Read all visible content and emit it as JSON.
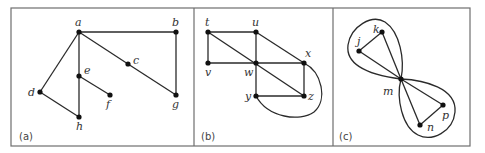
{
  "figure": {
    "panels": [
      {
        "id": "a",
        "caption": "(a)",
        "vertices": [
          {
            "id": "a",
            "label": "a"
          },
          {
            "id": "b",
            "label": "b"
          },
          {
            "id": "c",
            "label": "c"
          },
          {
            "id": "d",
            "label": "d"
          },
          {
            "id": "e",
            "label": "e"
          },
          {
            "id": "f",
            "label": "f"
          },
          {
            "id": "g",
            "label": "g"
          },
          {
            "id": "h",
            "label": "h"
          }
        ],
        "edges": [
          [
            "a",
            "b"
          ],
          [
            "b",
            "g"
          ],
          [
            "a",
            "c"
          ],
          [
            "c",
            "g"
          ],
          [
            "a",
            "d"
          ],
          [
            "a",
            "e"
          ],
          [
            "e",
            "h"
          ],
          [
            "e",
            "f"
          ],
          [
            "d",
            "h"
          ]
        ],
        "loops": []
      },
      {
        "id": "b",
        "caption": "(b)",
        "vertices": [
          {
            "id": "t",
            "label": "t"
          },
          {
            "id": "u",
            "label": "u"
          },
          {
            "id": "v",
            "label": "v"
          },
          {
            "id": "w",
            "label": "w"
          },
          {
            "id": "x",
            "label": "x"
          },
          {
            "id": "y",
            "label": "y"
          },
          {
            "id": "z",
            "label": "z"
          }
        ],
        "edges": [
          [
            "t",
            "u"
          ],
          [
            "t",
            "v"
          ],
          [
            "t",
            "w"
          ],
          [
            "w",
            "z"
          ],
          [
            "u",
            "w"
          ],
          [
            "u",
            "x"
          ],
          [
            "v",
            "w"
          ],
          [
            "w",
            "x"
          ],
          [
            "w",
            "y"
          ],
          [
            "x",
            "z"
          ],
          [
            "y",
            "z"
          ]
        ],
        "curved_edges": [
          [
            "y",
            "x"
          ]
        ],
        "loops": []
      },
      {
        "id": "c",
        "caption": "(c)",
        "vertices": [
          {
            "id": "j",
            "label": "j"
          },
          {
            "id": "k",
            "label": "k"
          },
          {
            "id": "m",
            "label": "m"
          },
          {
            "id": "n",
            "label": "n"
          },
          {
            "id": "p",
            "label": "p"
          }
        ],
        "edges": [
          [
            "j",
            "k"
          ],
          [
            "j",
            "m"
          ],
          [
            "k",
            "m"
          ],
          [
            "m",
            "n"
          ],
          [
            "m",
            "p"
          ],
          [
            "n",
            "p"
          ]
        ],
        "loops": [
          "m",
          "m"
        ]
      }
    ]
  }
}
